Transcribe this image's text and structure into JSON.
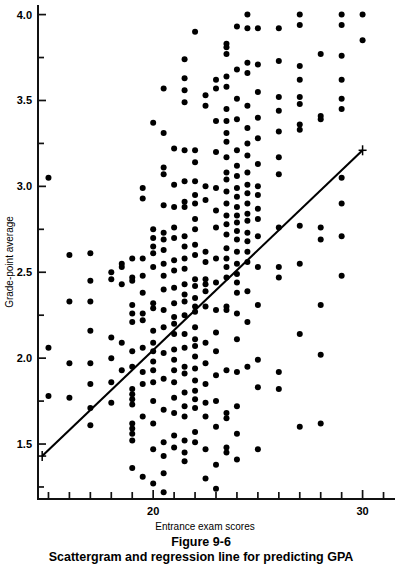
{
  "figure": {
    "caption_number": "Figure 9-6",
    "caption_text": "Scattergram and regression line for predicting GPA"
  },
  "chart_data": {
    "type": "scatter",
    "title": "Scattergram and regression line for predicting GPA",
    "xlabel": "Entrance exam scores",
    "ylabel": "Grade-point average",
    "grid": false,
    "legend": null,
    "xlim": [
      14.5,
      31.5
    ],
    "ylim": [
      1.18,
      4.05
    ],
    "x_major_ticks": [
      20,
      30
    ],
    "x_major_tick_labels": [
      "20",
      "30"
    ],
    "x_minor_ticks": [
      15,
      16,
      17,
      18,
      19,
      21,
      22,
      23,
      24,
      25,
      26,
      27,
      28,
      29,
      31
    ],
    "y_major_ticks": [
      1.5,
      2.0,
      2.5,
      3.0,
      3.5,
      4.0
    ],
    "y_major_tick_labels": [
      "1.5",
      "2.0",
      "2.5",
      "3.0",
      "3.5",
      "4.0"
    ],
    "y_minor_ticks": [
      1.25,
      1.75,
      2.25,
      2.75,
      3.25,
      3.75
    ],
    "regression_line": {
      "x_start": 14.7,
      "y_start": 1.43,
      "x_end": 30.0,
      "y_end": 3.21,
      "endpoint_marker": "cross"
    },
    "point_radius_px": 3.0,
    "points": [
      [
        15.0,
        3.05
      ],
      [
        15.0,
        2.06
      ],
      [
        15.0,
        1.78
      ],
      [
        16.0,
        2.6
      ],
      [
        16.0,
        2.33
      ],
      [
        16.0,
        1.97
      ],
      [
        16.0,
        1.77
      ],
      [
        17.0,
        2.61
      ],
      [
        17.0,
        2.45
      ],
      [
        17.0,
        2.33
      ],
      [
        17.0,
        2.16
      ],
      [
        17.0,
        1.97
      ],
      [
        17.0,
        1.85
      ],
      [
        17.0,
        1.71
      ],
      [
        17.0,
        1.61
      ],
      [
        18.0,
        2.5
      ],
      [
        18.0,
        2.46
      ],
      [
        18.0,
        2.12
      ],
      [
        18.0,
        2.0
      ],
      [
        18.0,
        1.86
      ],
      [
        18.0,
        1.74
      ],
      [
        18.5,
        2.55
      ],
      [
        18.5,
        2.53
      ],
      [
        18.5,
        2.43
      ],
      [
        18.5,
        2.09
      ],
      [
        18.5,
        1.93
      ],
      [
        19.0,
        2.58
      ],
      [
        19.0,
        2.47
      ],
      [
        19.0,
        2.45
      ],
      [
        19.0,
        2.31
      ],
      [
        19.0,
        2.26
      ],
      [
        19.0,
        2.21
      ],
      [
        19.0,
        2.04
      ],
      [
        19.0,
        1.95
      ],
      [
        19.0,
        1.82
      ],
      [
        19.0,
        1.79
      ],
      [
        19.0,
        1.76
      ],
      [
        19.0,
        1.73
      ],
      [
        19.0,
        1.62
      ],
      [
        19.0,
        1.59
      ],
      [
        19.0,
        1.56
      ],
      [
        19.0,
        1.52
      ],
      [
        19.0,
        1.36
      ],
      [
        19.5,
        2.99
      ],
      [
        19.5,
        2.93
      ],
      [
        19.5,
        2.58
      ],
      [
        19.5,
        2.48
      ],
      [
        19.5,
        2.38
      ],
      [
        19.5,
        2.26
      ],
      [
        19.5,
        2.22
      ],
      [
        19.5,
        2.06
      ],
      [
        19.5,
        1.92
      ],
      [
        19.5,
        1.85
      ],
      [
        19.5,
        1.66
      ],
      [
        19.5,
        1.31
      ],
      [
        20.0,
        3.37
      ],
      [
        20.0,
        2.75
      ],
      [
        20.0,
        2.7
      ],
      [
        20.0,
        2.65
      ],
      [
        20.0,
        2.61
      ],
      [
        20.0,
        2.53
      ],
      [
        20.0,
        2.32
      ],
      [
        20.0,
        2.29
      ],
      [
        20.0,
        2.16
      ],
      [
        20.0,
        2.09
      ],
      [
        20.0,
        2.04
      ],
      [
        20.0,
        1.98
      ],
      [
        20.0,
        1.93
      ],
      [
        20.0,
        1.86
      ],
      [
        20.0,
        1.75
      ],
      [
        20.0,
        1.62
      ],
      [
        20.0,
        1.47
      ],
      [
        20.0,
        1.27
      ],
      [
        20.5,
        3.57
      ],
      [
        20.5,
        3.31
      ],
      [
        20.5,
        3.11
      ],
      [
        20.5,
        3.07
      ],
      [
        20.5,
        2.89
      ],
      [
        20.5,
        2.73
      ],
      [
        20.5,
        2.69
      ],
      [
        20.5,
        2.63
      ],
      [
        20.5,
        2.55
      ],
      [
        20.5,
        2.48
      ],
      [
        20.5,
        2.4
      ],
      [
        20.5,
        2.28
      ],
      [
        20.5,
        2.18
      ],
      [
        20.5,
        2.03
      ],
      [
        20.5,
        1.88
      ],
      [
        20.5,
        1.7
      ],
      [
        20.5,
        1.51
      ],
      [
        20.5,
        1.43
      ],
      [
        20.5,
        1.33
      ],
      [
        20.5,
        1.22
      ],
      [
        21.0,
        3.22
      ],
      [
        21.0,
        3.01
      ],
      [
        21.0,
        2.88
      ],
      [
        21.0,
        2.76
      ],
      [
        21.0,
        2.7
      ],
      [
        21.0,
        2.57
      ],
      [
        21.0,
        2.51
      ],
      [
        21.0,
        2.41
      ],
      [
        21.0,
        2.32
      ],
      [
        21.0,
        2.24
      ],
      [
        21.0,
        2.2
      ],
      [
        21.0,
        2.14
      ],
      [
        21.0,
        2.05
      ],
      [
        21.0,
        1.99
      ],
      [
        21.0,
        1.93
      ],
      [
        21.0,
        1.86
      ],
      [
        21.0,
        1.77
      ],
      [
        21.0,
        1.68
      ],
      [
        21.0,
        1.55
      ],
      [
        21.0,
        1.48
      ],
      [
        21.5,
        3.74
      ],
      [
        21.5,
        3.63
      ],
      [
        21.5,
        3.56
      ],
      [
        21.5,
        3.49
      ],
      [
        21.5,
        3.21
      ],
      [
        21.5,
        3.03
      ],
      [
        21.5,
        2.91
      ],
      [
        21.5,
        2.88
      ],
      [
        21.5,
        2.71
      ],
      [
        21.5,
        2.65
      ],
      [
        21.5,
        2.58
      ],
      [
        21.5,
        2.52
      ],
      [
        21.5,
        2.43
      ],
      [
        21.5,
        2.37
      ],
      [
        21.5,
        2.33
      ],
      [
        21.5,
        2.25
      ],
      [
        21.5,
        2.14
      ],
      [
        21.5,
        2.06
      ],
      [
        21.5,
        1.95
      ],
      [
        21.5,
        1.91
      ],
      [
        21.5,
        1.8
      ],
      [
        21.5,
        1.72
      ],
      [
        21.5,
        1.66
      ],
      [
        21.5,
        1.52
      ],
      [
        21.5,
        1.45
      ],
      [
        21.5,
        1.4
      ],
      [
        22.0,
        3.9
      ],
      [
        22.0,
        3.21
      ],
      [
        22.0,
        3.14
      ],
      [
        22.0,
        3.03
      ],
      [
        22.0,
        2.95
      ],
      [
        22.0,
        2.9
      ],
      [
        22.0,
        2.81
      ],
      [
        22.0,
        2.75
      ],
      [
        22.0,
        2.66
      ],
      [
        22.0,
        2.6
      ],
      [
        22.0,
        2.46
      ],
      [
        22.0,
        2.42
      ],
      [
        22.0,
        2.35
      ],
      [
        22.0,
        2.3
      ],
      [
        22.0,
        2.27
      ],
      [
        22.0,
        2.18
      ],
      [
        22.0,
        2.11
      ],
      [
        22.0,
        2.07
      ],
      [
        22.0,
        2.01
      ],
      [
        22.0,
        1.94
      ],
      [
        22.0,
        1.87
      ],
      [
        22.0,
        1.81
      ],
      [
        22.0,
        1.76
      ],
      [
        22.0,
        1.71
      ],
      [
        22.0,
        1.57
      ],
      [
        22.0,
        1.51
      ],
      [
        22.5,
        3.53
      ],
      [
        22.5,
        3.47
      ],
      [
        22.5,
        3.0
      ],
      [
        22.5,
        2.92
      ],
      [
        22.5,
        2.62
      ],
      [
        22.5,
        2.56
      ],
      [
        22.5,
        2.46
      ],
      [
        22.5,
        2.43
      ],
      [
        22.5,
        2.39
      ],
      [
        22.5,
        2.3
      ],
      [
        22.5,
        2.09
      ],
      [
        22.5,
        1.97
      ],
      [
        22.5,
        1.85
      ],
      [
        22.5,
        1.74
      ],
      [
        22.5,
        1.66
      ],
      [
        22.5,
        1.47
      ],
      [
        22.5,
        1.3
      ],
      [
        23.0,
        3.62
      ],
      [
        23.0,
        3.57
      ],
      [
        23.0,
        3.38
      ],
      [
        23.0,
        3.2
      ],
      [
        23.0,
        2.99
      ],
      [
        23.0,
        2.86
      ],
      [
        23.0,
        2.76
      ],
      [
        23.0,
        2.58
      ],
      [
        23.0,
        2.44
      ],
      [
        23.0,
        2.28
      ],
      [
        23.0,
        2.15
      ],
      [
        23.0,
        2.04
      ],
      [
        23.0,
        1.9
      ],
      [
        23.0,
        1.75
      ],
      [
        23.0,
        1.6
      ],
      [
        23.0,
        1.38
      ],
      [
        23.0,
        1.24
      ],
      [
        23.5,
        3.83
      ],
      [
        23.5,
        3.81
      ],
      [
        23.5,
        3.77
      ],
      [
        23.5,
        3.64
      ],
      [
        23.5,
        3.58
      ],
      [
        23.5,
        3.45
      ],
      [
        23.5,
        3.38
      ],
      [
        23.5,
        3.31
      ],
      [
        23.5,
        3.26
      ],
      [
        23.5,
        3.17
      ],
      [
        23.5,
        3.08
      ],
      [
        23.5,
        3.04
      ],
      [
        23.5,
        2.97
      ],
      [
        23.5,
        2.9
      ],
      [
        23.5,
        2.83
      ],
      [
        23.5,
        2.78
      ],
      [
        23.5,
        2.72
      ],
      [
        23.5,
        2.64
      ],
      [
        23.5,
        2.58
      ],
      [
        23.5,
        2.53
      ],
      [
        23.5,
        2.47
      ],
      [
        23.5,
        2.3
      ],
      [
        23.5,
        2.28
      ],
      [
        23.5,
        1.93
      ],
      [
        23.5,
        1.68
      ],
      [
        23.5,
        1.65
      ],
      [
        23.5,
        1.48
      ],
      [
        23.5,
        1.45
      ],
      [
        24.0,
        3.93
      ],
      [
        24.0,
        3.68
      ],
      [
        24.0,
        3.51
      ],
      [
        24.0,
        3.39
      ],
      [
        24.0,
        3.21
      ],
      [
        24.0,
        3.12
      ],
      [
        24.0,
        3.06
      ],
      [
        24.0,
        2.99
      ],
      [
        24.0,
        2.94
      ],
      [
        24.0,
        2.88
      ],
      [
        24.0,
        2.83
      ],
      [
        24.0,
        2.79
      ],
      [
        24.0,
        2.74
      ],
      [
        24.0,
        2.69
      ],
      [
        24.0,
        2.62
      ],
      [
        24.0,
        2.55
      ],
      [
        24.0,
        2.49
      ],
      [
        24.0,
        2.44
      ],
      [
        24.0,
        2.38
      ],
      [
        24.0,
        2.26
      ],
      [
        24.0,
        2.11
      ],
      [
        24.0,
        1.92
      ],
      [
        24.0,
        1.72
      ],
      [
        24.0,
        1.56
      ],
      [
        24.0,
        1.41
      ],
      [
        24.5,
        4.0
      ],
      [
        24.5,
        3.92
      ],
      [
        24.5,
        3.72
      ],
      [
        24.5,
        3.66
      ],
      [
        24.5,
        3.47
      ],
      [
        24.5,
        3.34
      ],
      [
        24.5,
        3.25
      ],
      [
        24.5,
        3.18
      ],
      [
        24.5,
        3.08
      ],
      [
        24.5,
        3.01
      ],
      [
        24.5,
        2.96
      ],
      [
        24.5,
        2.9
      ],
      [
        24.5,
        2.84
      ],
      [
        24.5,
        2.8
      ],
      [
        24.5,
        2.73
      ],
      [
        24.5,
        2.68
      ],
      [
        24.5,
        2.62
      ],
      [
        24.5,
        2.56
      ],
      [
        24.5,
        2.39
      ],
      [
        24.5,
        2.21
      ],
      [
        24.5,
        1.95
      ],
      [
        25.0,
        3.92
      ],
      [
        25.0,
        3.71
      ],
      [
        25.0,
        3.55
      ],
      [
        25.0,
        3.4
      ],
      [
        25.0,
        3.28
      ],
      [
        25.0,
        3.13
      ],
      [
        25.0,
        3.0
      ],
      [
        25.0,
        2.95
      ],
      [
        25.0,
        2.87
      ],
      [
        25.0,
        2.81
      ],
      [
        25.0,
        2.71
      ],
      [
        25.0,
        2.53
      ],
      [
        25.0,
        2.31
      ],
      [
        25.0,
        1.99
      ],
      [
        25.0,
        1.83
      ],
      [
        25.0,
        1.47
      ],
      [
        26.0,
        3.92
      ],
      [
        26.0,
        3.73
      ],
      [
        26.0,
        3.52
      ],
      [
        26.0,
        3.44
      ],
      [
        26.0,
        3.32
      ],
      [
        26.0,
        3.17
      ],
      [
        26.0,
        3.07
      ],
      [
        26.0,
        2.76
      ],
      [
        26.0,
        2.53
      ],
      [
        26.0,
        2.47
      ],
      [
        26.0,
        1.92
      ],
      [
        26.0,
        1.82
      ],
      [
        27.0,
        4.0
      ],
      [
        27.0,
        3.94
      ],
      [
        27.0,
        3.7
      ],
      [
        27.0,
        3.62
      ],
      [
        27.0,
        3.52
      ],
      [
        27.0,
        3.48
      ],
      [
        27.0,
        3.36
      ],
      [
        27.0,
        3.33
      ],
      [
        27.0,
        2.77
      ],
      [
        27.0,
        2.55
      ],
      [
        27.0,
        2.14
      ],
      [
        27.0,
        1.6
      ],
      [
        28.0,
        3.77
      ],
      [
        28.0,
        3.41
      ],
      [
        28.0,
        3.39
      ],
      [
        28.0,
        2.76
      ],
      [
        28.0,
        2.69
      ],
      [
        28.0,
        2.31
      ],
      [
        28.0,
        2.02
      ],
      [
        28.0,
        1.62
      ],
      [
        29.0,
        4.0
      ],
      [
        29.0,
        3.94
      ],
      [
        29.0,
        3.76
      ],
      [
        29.0,
        3.62
      ],
      [
        29.0,
        3.51
      ],
      [
        29.0,
        3.45
      ],
      [
        29.0,
        3.05
      ],
      [
        29.0,
        2.9
      ],
      [
        29.0,
        2.71
      ],
      [
        29.0,
        2.48
      ],
      [
        30.0,
        4.0
      ],
      [
        30.0,
        3.85
      ]
    ]
  }
}
